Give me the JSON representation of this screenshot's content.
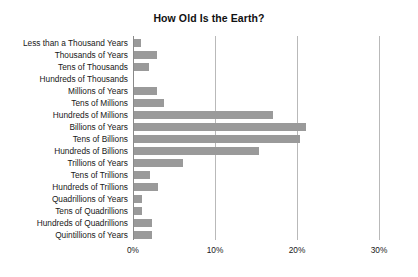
{
  "chart_data": {
    "type": "bar",
    "orientation": "horizontal",
    "title": "How Old Is the Earth?",
    "xlabel": "",
    "ylabel": "",
    "xlim": [
      0,
      30
    ],
    "xtick_labels": [
      "0%",
      "10%",
      "20%",
      "30%"
    ],
    "xtick_values": [
      0,
      10,
      20,
      30
    ],
    "grid": true,
    "legend": "none",
    "bar_color": "#9a9a9a",
    "grid_color": "#b9b9b9",
    "axis_color": "#8a8a8a",
    "categories": [
      "Less than a Thousand Years",
      "Thousands of Years",
      "Tens of Thousands",
      "Hundreds of Thousands",
      "Millions of Years",
      "Tens of Millions",
      "Hundreds of Millions",
      "Billions of Years",
      "Tens of Billions",
      "Hundreds of Billions",
      "Trillions of Years",
      "Tens of Trillions",
      "Hundreds of Trillions",
      "Quadrillions of Years",
      "Tens of Quadrillions",
      "Hundreds of Quadrillions",
      "Quintillions of Years"
    ],
    "values": [
      0.9,
      2.8,
      1.8,
      0.0,
      2.8,
      3.7,
      17.0,
      21.0,
      20.2,
      15.2,
      6.0,
      2.0,
      2.9,
      1.0,
      1.0,
      2.2,
      2.2
    ]
  }
}
